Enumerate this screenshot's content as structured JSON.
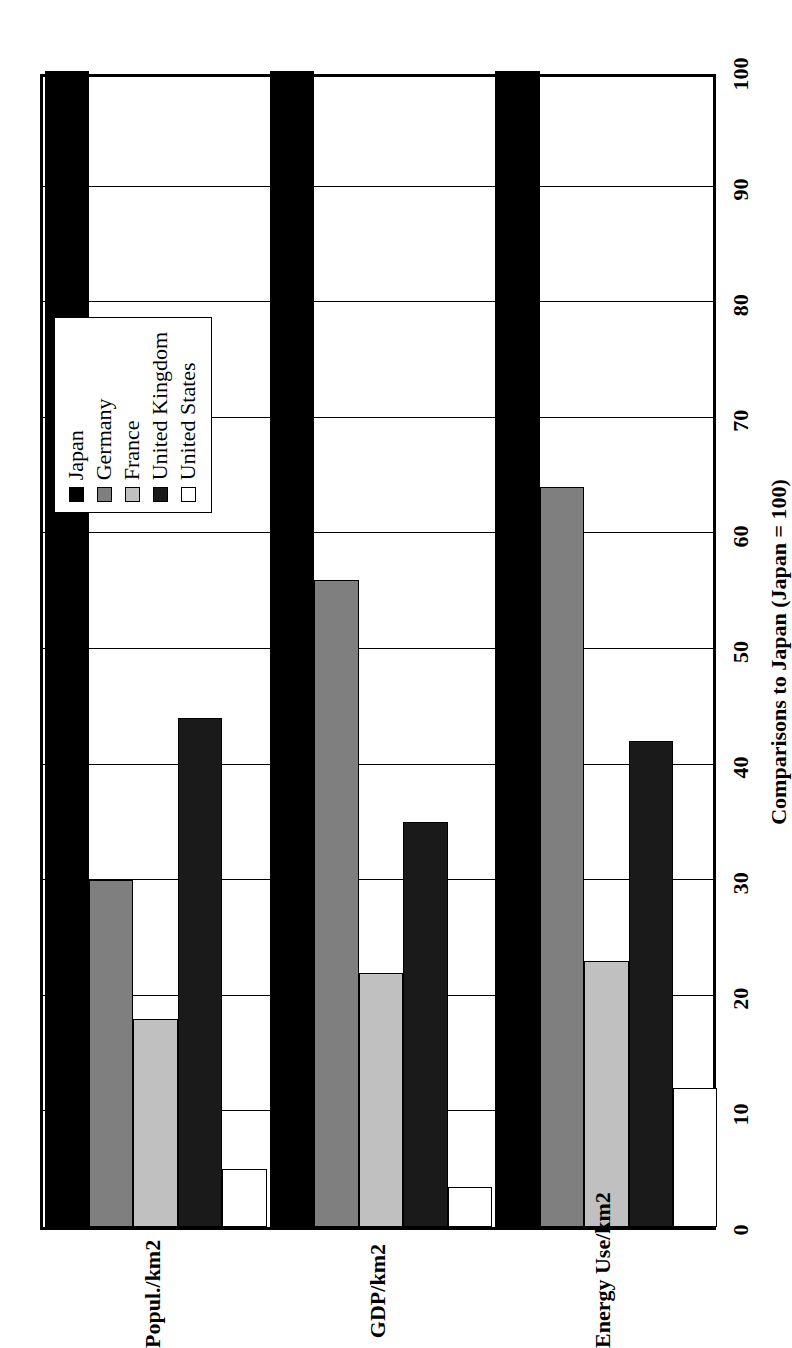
{
  "chart_data": {
    "type": "bar",
    "orientation": "horizontal-grouped",
    "title": "",
    "xlabel": "Comparisons to Japan (Japan = 100)",
    "ylabel": "",
    "categories": [
      "Popul./km2",
      "GDP/km2",
      "Energy Use/km2"
    ],
    "series": [
      {
        "name": "Japan",
        "color": "#000000",
        "values": [
          100,
          100,
          100
        ]
      },
      {
        "name": "Germany",
        "color": "#7f7f7f",
        "values": [
          30,
          56,
          64
        ]
      },
      {
        "name": "France",
        "color": "#c0c0c0",
        "values": [
          18,
          22,
          23
        ]
      },
      {
        "name": "United Kingdom",
        "color": "#1a1a1a",
        "values": [
          44,
          35,
          42
        ]
      },
      {
        "name": "United States",
        "color": "#ffffff",
        "values": [
          5,
          3.5,
          12
        ]
      }
    ],
    "axis": {
      "ticks": [
        "0",
        "10",
        "20",
        "30",
        "40",
        "50",
        "60",
        "70",
        "80",
        "90",
        "100"
      ],
      "min": 0,
      "max": 100,
      "step": 10,
      "grid": true
    },
    "legend": {
      "position": "top-left-inside",
      "entries": [
        "Japan",
        "Germany",
        "France",
        "United Kingdom",
        "United States"
      ]
    }
  },
  "axis_title": "Comparisons to Japan (Japan = 100)",
  "tick_labels": [
    "0",
    "10",
    "20",
    "30",
    "40",
    "50",
    "60",
    "70",
    "80",
    "90",
    "100"
  ],
  "category_labels": [
    "Popul./km2",
    "GDP/km2",
    "Energy Use/km2"
  ],
  "legend_labels": [
    "Japan",
    "Germany",
    "France",
    "United Kingdom",
    "United States"
  ],
  "colors": {
    "japan": "#000000",
    "germany": "#7f7f7f",
    "france": "#c0c0c0",
    "united_kingdom": "#1a1a1a",
    "united_states": "#ffffff",
    "axis": "#000000",
    "background": "#ffffff"
  }
}
